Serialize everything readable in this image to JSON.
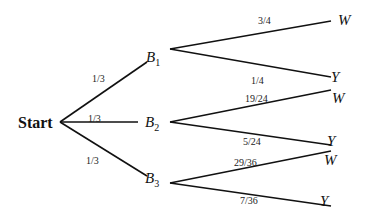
{
  "diagram": {
    "type": "probability-tree",
    "root": {
      "label": "Start"
    },
    "level1": [
      {
        "name": "B",
        "sub": "1",
        "prob": "1/3"
      },
      {
        "name": "B",
        "sub": "2",
        "prob": "1/3"
      },
      {
        "name": "B",
        "sub": "3",
        "prob": "1/3"
      }
    ],
    "level2": [
      {
        "parent": "B1",
        "outcome": "W",
        "prob": "3/4"
      },
      {
        "parent": "B1",
        "outcome": "Y",
        "prob": "1/4"
      },
      {
        "parent": "B2",
        "outcome": "W",
        "prob": "19/24"
      },
      {
        "parent": "B2",
        "outcome": "Y",
        "prob": "5/24"
      },
      {
        "parent": "B3",
        "outcome": "W",
        "prob": "29/36"
      },
      {
        "parent": "B3",
        "outcome": "Y",
        "prob": "7/36"
      }
    ]
  }
}
